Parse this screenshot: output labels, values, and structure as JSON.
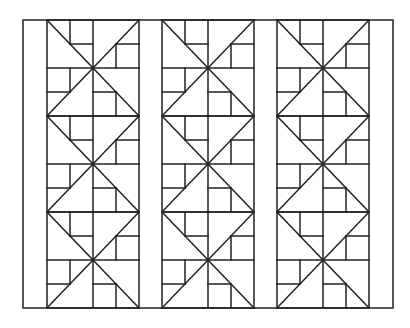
{
  "frame": {
    "x": 23,
    "y": 20,
    "width": 370,
    "height": 288
  },
  "stroke": {
    "color": "#222222",
    "width": 1.5
  },
  "block": {
    "width": 92,
    "height": 96,
    "rows": 3
  },
  "columns": [
    {
      "x": 47
    },
    {
      "x": 162
    },
    {
      "x": 277
    }
  ]
}
